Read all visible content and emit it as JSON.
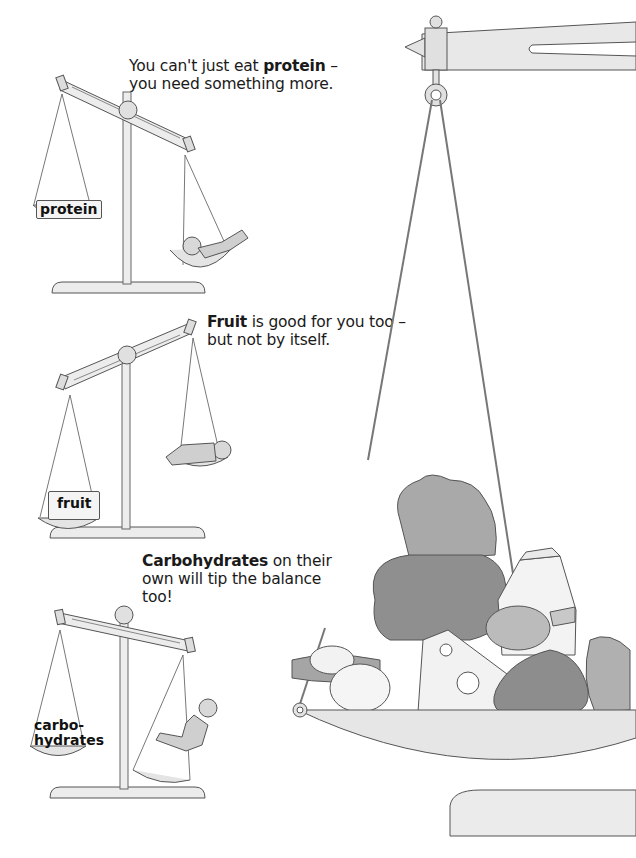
{
  "page": {
    "captions": [
      {
        "pre": "You can't just eat ",
        "bold": "protein",
        "post": " –",
        "line2": "you need something more."
      },
      {
        "pre": "",
        "bold": "Fruit",
        "post": " is good for you too –",
        "line2": "but not by itself."
      },
      {
        "pre": "",
        "bold": "Carbohydrates",
        "post": " on their",
        "line2": "own will tip the balance",
        "line3": "too!"
      }
    ],
    "scales": [
      {
        "label": "protein",
        "tilt": "left-heavy",
        "child_side": "right",
        "child_pose": "lying"
      },
      {
        "label": "fruit",
        "tilt": "left-heavy",
        "child_side": "right",
        "child_pose": "crouching"
      },
      {
        "label_line1": "carbo-",
        "label_line2": "hydrates",
        "tilt": "left-heavy",
        "child_side": "right",
        "child_pose": "climbing"
      }
    ],
    "big_scale": {
      "foods": [
        "lettuce",
        "bread",
        "milk carton",
        "cheese",
        "potatoes",
        "pear",
        "meat",
        "leek",
        "onions"
      ]
    },
    "colors": {
      "ink": "#1a1a1a",
      "metal": "#e6e6e6",
      "outline": "#555555",
      "food_dark": "#8a8a8a",
      "food_mid": "#b5b5b5"
    }
  }
}
